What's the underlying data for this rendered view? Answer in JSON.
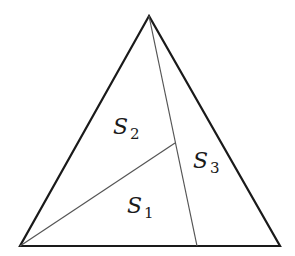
{
  "diagram": {
    "title": "",
    "colors": {
      "outline": "#1a1a1a",
      "inner_lines": "#555555",
      "background": "#ffffff"
    },
    "vertices": {
      "apex": [
        149,
        16
      ],
      "bottom_left": [
        20,
        246
      ],
      "bottom_right": [
        280,
        246
      ],
      "interior_point": [
        175,
        143
      ],
      "base_point": [
        197,
        246
      ]
    },
    "segments": [
      {
        "from": "apex",
        "to": "base_point",
        "style": "thin"
      },
      {
        "from": "bottom_left",
        "to": "interior_point",
        "style": "thin"
      }
    ],
    "regions": [
      {
        "id": "S1",
        "letter": "S",
        "subscript": "1"
      },
      {
        "id": "S2",
        "letter": "S",
        "subscript": "2"
      },
      {
        "id": "S3",
        "letter": "S",
        "subscript": "3"
      }
    ]
  }
}
